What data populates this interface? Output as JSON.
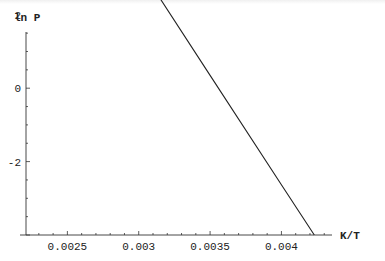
{
  "chart_data": {
    "type": "line",
    "title": "",
    "xlabel": "K/T",
    "ylabel": "ln P",
    "xlim": [
      0.00221,
      0.00439
    ],
    "ylim": [
      -4.0,
      6.5
    ],
    "grid": false,
    "legend": null,
    "x_ticks": [
      {
        "value": 0.0025,
        "label": "0.0025"
      },
      {
        "value": 0.003,
        "label": "0.003"
      },
      {
        "value": 0.0035,
        "label": "0.0035"
      },
      {
        "value": 0.004,
        "label": "0.004"
      }
    ],
    "y_ticks": [
      {
        "value": -2,
        "label": "-2"
      },
      {
        "value": 0,
        "label": "0"
      },
      {
        "value": 2,
        "label": "2"
      },
      {
        "value": 4,
        "label": "4"
      },
      {
        "value": 6,
        "label": "6"
      }
    ],
    "series": [
      {
        "name": "ln P vs 1/T",
        "x": [
          0.00247,
          0.003,
          0.0035,
          0.004,
          0.00423
        ],
        "y": [
          6.5,
          3.34,
          0.35,
          -2.63,
          -4.0
        ]
      }
    ]
  },
  "layout": {
    "plot": {
      "x0": 26,
      "y_axis_top": 32,
      "x_axis_y": 235,
      "x_axis_right": 332
    },
    "px_per_x": 142700,
    "px_per_y": 36.7,
    "x_axis_x_start": 20
  }
}
